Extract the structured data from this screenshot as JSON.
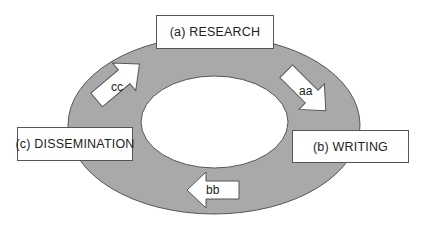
{
  "diagram": {
    "title": "",
    "colors": {
      "ring_fill": "#a9a9a9",
      "ring_stroke": "#555555",
      "inner_fill": "#ffffff",
      "box_fill": "#ffffff",
      "box_stroke": "#555555",
      "arrow_fill": "#ffffff",
      "text": "#222222"
    },
    "nodes": [
      {
        "id": "research",
        "label": "(a) RESEARCH"
      },
      {
        "id": "writing",
        "label": "(b) WRITING"
      },
      {
        "id": "dissemination",
        "label": "(c) DISSEMINATION"
      }
    ],
    "arrows": [
      {
        "id": "aa",
        "label": "aa",
        "from": "research",
        "to": "writing",
        "direction": "down-right"
      },
      {
        "id": "bb",
        "label": "bb",
        "from": "writing",
        "to": "dissemination",
        "direction": "left"
      },
      {
        "id": "cc",
        "label": "cc",
        "from": "dissemination",
        "to": "research",
        "direction": "up-right"
      }
    ]
  }
}
